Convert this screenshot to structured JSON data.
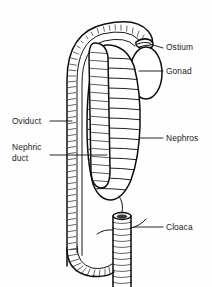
{
  "figure": {
    "background_color": "#fefefe",
    "ink_color": "#111111",
    "labels": [
      {
        "id": "ostium",
        "text": "Ostium",
        "x": 166,
        "y": 50
      },
      {
        "id": "gonad",
        "text": "Gonad",
        "x": 166,
        "y": 74
      },
      {
        "id": "oviduct",
        "text": "Oviduct",
        "x": 12,
        "y": 124
      },
      {
        "id": "nephric_duct_line1",
        "text": "Nephric",
        "x": 12,
        "y": 150
      },
      {
        "id": "nephric_duct_line2",
        "text": "duct",
        "x": 12,
        "y": 161
      },
      {
        "id": "nephros",
        "text": "Nephros",
        "x": 166,
        "y": 141
      },
      {
        "id": "cloaca",
        "text": "Cloaca",
        "x": 166,
        "y": 230
      }
    ],
    "structures": [
      {
        "id": "oviduct-tube",
        "name": "Oviduct",
        "style": "ciliated-hatched-loop"
      },
      {
        "id": "ostium-funnel",
        "name": "Ostium",
        "style": "funnel-opening"
      },
      {
        "id": "gonad-body",
        "name": "Gonad",
        "style": "oval"
      },
      {
        "id": "nephros-body",
        "name": "Nephros",
        "style": "segmented-elongated"
      },
      {
        "id": "nephric-duct-strip",
        "name": "Nephric duct",
        "style": "narrow-tubule-strip"
      },
      {
        "id": "cloaca-tube",
        "name": "Cloaca",
        "style": "ridged-vertical-tube"
      }
    ]
  }
}
